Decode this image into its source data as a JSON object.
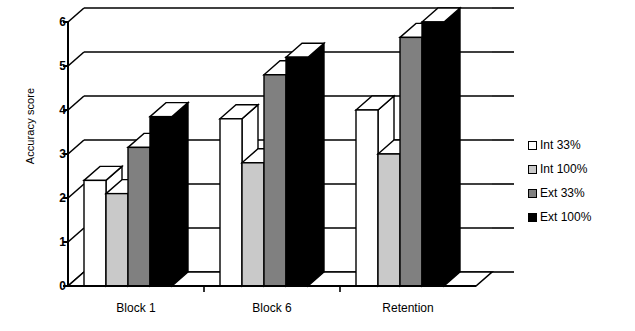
{
  "chart_data": {
    "type": "bar",
    "title": "",
    "subtitle": "",
    "xlabel": "",
    "ylabel": "Accuracy score",
    "categories": [
      "Block 1",
      "Block 6",
      "Retention"
    ],
    "series": [
      {
        "name": "Int 33%",
        "values": [
          2.4,
          3.8,
          4.0
        ],
        "color": "#ffffff"
      },
      {
        "name": "Int 100%",
        "values": [
          2.1,
          2.8,
          3.0
        ],
        "color": "#c9c9c9"
      },
      {
        "name": "Ext 33%",
        "values": [
          3.15,
          4.8,
          5.65
        ],
        "color": "#808080"
      },
      {
        "name": "Ext 100%",
        "values": [
          3.85,
          5.2,
          6.0
        ],
        "color": "#000000"
      }
    ],
    "ylim": [
      0,
      6
    ],
    "yticks": [
      0,
      1,
      2,
      3,
      4,
      5,
      6
    ],
    "ytick_labels": [
      "0",
      "1",
      "2",
      "3",
      "4",
      "5",
      "6"
    ],
    "grid": true,
    "grid_axis": "y",
    "legend_position": "right",
    "style": "3d-grouped-bar",
    "background": "#ffffff",
    "axis_color": "#000000"
  },
  "legend": {
    "entries": [
      {
        "label": "Int 33%",
        "swatch": "#ffffff"
      },
      {
        "label": "Int 100%",
        "swatch": "#c9c9c9"
      },
      {
        "label": "Ext 33%",
        "swatch": "#808080"
      },
      {
        "label": "Ext 100%",
        "swatch": "#000000"
      }
    ]
  }
}
